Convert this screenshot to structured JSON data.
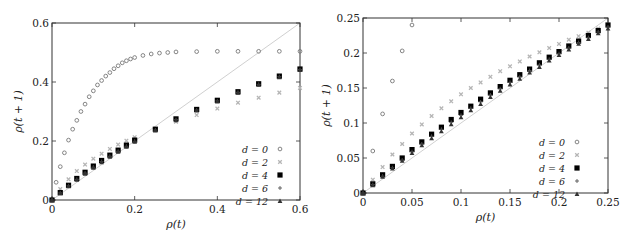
{
  "chart_data": [
    {
      "id": "left",
      "type": "scatter",
      "title": "",
      "xlabel": "ρ(t)",
      "ylabel": "ρ(t + 1)",
      "xlim": [
        0,
        0.6
      ],
      "ylim": [
        0,
        0.6
      ],
      "xticks": [
        0,
        0.2,
        0.4,
        0.6
      ],
      "xtick_labels": [
        "0",
        "0.2",
        "0.4",
        "0.6"
      ],
      "yticks": [
        0,
        0.2,
        0.4,
        0.6
      ],
      "ytick_labels": [
        "0",
        "0.2",
        "0.4",
        "0.6"
      ],
      "grid": false,
      "legend_position": "lower right",
      "reference_line": {
        "label": "y = x",
        "color": "#d0d0d0"
      },
      "series": [
        {
          "name": "d = 0",
          "marker": "open-circle",
          "color": "#777777",
          "x": [
            0,
            0.01,
            0.02,
            0.03,
            0.04,
            0.05,
            0.06,
            0.07,
            0.08,
            0.09,
            0.1,
            0.11,
            0.12,
            0.13,
            0.14,
            0.15,
            0.16,
            0.17,
            0.18,
            0.19,
            0.2,
            0.22,
            0.24,
            0.26,
            0.28,
            0.3,
            0.35,
            0.4,
            0.45,
            0.5,
            0.55,
            0.6
          ],
          "y": [
            0,
            0.06,
            0.113,
            0.16,
            0.203,
            0.24,
            0.27,
            0.3,
            0.325,
            0.35,
            0.37,
            0.39,
            0.405,
            0.42,
            0.432,
            0.445,
            0.455,
            0.465,
            0.472,
            0.478,
            0.483,
            0.49,
            0.495,
            0.498,
            0.5,
            0.502,
            0.503,
            0.504,
            0.504,
            0.504,
            0.504,
            0.504
          ]
        },
        {
          "name": "d = 2",
          "marker": "x-cross",
          "color": "#b5b5b5",
          "x": [
            0,
            0.02,
            0.04,
            0.06,
            0.08,
            0.1,
            0.12,
            0.14,
            0.16,
            0.18,
            0.2,
            0.25,
            0.3,
            0.35,
            0.4,
            0.45,
            0.5,
            0.55,
            0.6
          ],
          "y": [
            0,
            0.037,
            0.07,
            0.098,
            0.12,
            0.14,
            0.157,
            0.173,
            0.188,
            0.201,
            0.213,
            0.24,
            0.265,
            0.288,
            0.31,
            0.33,
            0.347,
            0.364,
            0.38
          ]
        },
        {
          "name": "d = 4",
          "marker": "filled-square",
          "color": "#000000",
          "x": [
            0,
            0.02,
            0.04,
            0.06,
            0.08,
            0.1,
            0.12,
            0.14,
            0.16,
            0.18,
            0.2,
            0.25,
            0.3,
            0.35,
            0.4,
            0.45,
            0.5,
            0.55,
            0.6
          ],
          "y": [
            0,
            0.025,
            0.05,
            0.073,
            0.094,
            0.115,
            0.134,
            0.152,
            0.169,
            0.186,
            0.203,
            0.24,
            0.275,
            0.307,
            0.338,
            0.367,
            0.394,
            0.42,
            0.444
          ]
        },
        {
          "name": "d = 6",
          "marker": "plus",
          "color": "#555555",
          "x": [
            0,
            0.02,
            0.04,
            0.06,
            0.08,
            0.1,
            0.12,
            0.14,
            0.16,
            0.18,
            0.2,
            0.25,
            0.3,
            0.35,
            0.4,
            0.45,
            0.5,
            0.55,
            0.6
          ],
          "y": [
            0,
            0.024,
            0.048,
            0.07,
            0.091,
            0.111,
            0.13,
            0.148,
            0.165,
            0.182,
            0.199,
            0.237,
            0.272,
            0.305,
            0.336,
            0.365,
            0.392,
            0.418,
            0.442
          ]
        },
        {
          "name": "d = 12",
          "marker": "filled-triangle",
          "color": "#333333",
          "x": [
            0,
            0.02,
            0.04,
            0.06,
            0.08,
            0.1,
            0.12,
            0.14,
            0.16,
            0.18,
            0.2,
            0.25,
            0.3,
            0.35,
            0.4,
            0.45,
            0.5,
            0.55,
            0.6
          ],
          "y": [
            0,
            0.023,
            0.046,
            0.068,
            0.089,
            0.109,
            0.128,
            0.146,
            0.163,
            0.18,
            0.197,
            0.235,
            0.27,
            0.303,
            0.334,
            0.363,
            0.39,
            0.416,
            0.44
          ]
        }
      ]
    },
    {
      "id": "right",
      "type": "scatter",
      "title": "",
      "xlabel": "ρ(t)",
      "ylabel": "ρ(t + 1)",
      "xlim": [
        0,
        0.25
      ],
      "ylim": [
        0,
        0.25
      ],
      "xticks": [
        0,
        0.05,
        0.1,
        0.15,
        0.2,
        0.25
      ],
      "xtick_labels": [
        "0",
        "0.05",
        "0.1",
        "0.15",
        "0.2",
        "0.25"
      ],
      "yticks": [
        0,
        0.05,
        0.1,
        0.15,
        0.2,
        0.25
      ],
      "ytick_labels": [
        "0",
        "0.05",
        "0.1",
        "0.15",
        "0.2",
        "0.25"
      ],
      "grid": false,
      "legend_position": "lower right",
      "reference_line": {
        "label": "y = x",
        "color": "#d0d0d0"
      },
      "series": [
        {
          "name": "d = 0",
          "marker": "open-circle",
          "color": "#777777",
          "x": [
            0,
            0.01,
            0.02,
            0.03,
            0.04,
            0.05
          ],
          "y": [
            0,
            0.06,
            0.113,
            0.16,
            0.203,
            0.24
          ]
        },
        {
          "name": "d = 2",
          "marker": "x-cross",
          "color": "#b5b5b5",
          "x": [
            0,
            0.01,
            0.02,
            0.03,
            0.04,
            0.05,
            0.06,
            0.07,
            0.08,
            0.09,
            0.1,
            0.11,
            0.12,
            0.13,
            0.14,
            0.15,
            0.16,
            0.17,
            0.18,
            0.19,
            0.2,
            0.21,
            0.22,
            0.23,
            0.24,
            0.25
          ],
          "y": [
            0,
            0.019,
            0.037,
            0.055,
            0.07,
            0.085,
            0.098,
            0.11,
            0.121,
            0.131,
            0.141,
            0.15,
            0.158,
            0.166,
            0.174,
            0.181,
            0.188,
            0.195,
            0.201,
            0.207,
            0.213,
            0.219,
            0.224,
            0.229,
            0.235,
            0.24
          ]
        },
        {
          "name": "d = 4",
          "marker": "filled-square",
          "color": "#000000",
          "x": [
            0,
            0.01,
            0.02,
            0.03,
            0.04,
            0.05,
            0.06,
            0.07,
            0.08,
            0.09,
            0.1,
            0.11,
            0.12,
            0.13,
            0.14,
            0.15,
            0.16,
            0.17,
            0.18,
            0.19,
            0.2,
            0.21,
            0.22,
            0.23,
            0.24,
            0.25
          ],
          "y": [
            0,
            0.013,
            0.026,
            0.038,
            0.05,
            0.062,
            0.073,
            0.084,
            0.094,
            0.105,
            0.115,
            0.124,
            0.134,
            0.143,
            0.152,
            0.161,
            0.169,
            0.177,
            0.186,
            0.194,
            0.202,
            0.21,
            0.217,
            0.225,
            0.232,
            0.24
          ]
        },
        {
          "name": "d = 6",
          "marker": "plus",
          "color": "#555555",
          "x": [
            0,
            0.01,
            0.02,
            0.03,
            0.04,
            0.05,
            0.06,
            0.07,
            0.08,
            0.09,
            0.1,
            0.11,
            0.12,
            0.13,
            0.14,
            0.15,
            0.16,
            0.17,
            0.18,
            0.19,
            0.2,
            0.21,
            0.22,
            0.23,
            0.24,
            0.25
          ],
          "y": [
            0,
            0.012,
            0.024,
            0.036,
            0.047,
            0.059,
            0.07,
            0.081,
            0.091,
            0.101,
            0.111,
            0.121,
            0.13,
            0.14,
            0.149,
            0.158,
            0.166,
            0.175,
            0.183,
            0.191,
            0.199,
            0.207,
            0.215,
            0.222,
            0.23,
            0.237
          ]
        },
        {
          "name": "d = 12",
          "marker": "filled-triangle",
          "color": "#333333",
          "x": [
            0,
            0.01,
            0.02,
            0.03,
            0.04,
            0.05,
            0.06,
            0.07,
            0.08,
            0.09,
            0.1,
            0.11,
            0.12,
            0.13,
            0.14,
            0.15,
            0.16,
            0.17,
            0.18,
            0.19,
            0.2,
            0.21,
            0.22,
            0.23,
            0.24,
            0.25
          ],
          "y": [
            0,
            0.011,
            0.023,
            0.035,
            0.046,
            0.057,
            0.068,
            0.078,
            0.088,
            0.098,
            0.108,
            0.118,
            0.127,
            0.137,
            0.146,
            0.155,
            0.163,
            0.172,
            0.18,
            0.189,
            0.197,
            0.205,
            0.213,
            0.22,
            0.228,
            0.235
          ]
        }
      ]
    }
  ],
  "layout": {
    "left": {
      "plot": {
        "x0": 52,
        "x1": 300,
        "y0": 200,
        "y1": 23
      },
      "legend": {
        "x": 268,
        "y": 149,
        "dy": 13
      }
    },
    "right": {
      "plot": {
        "x0": 48,
        "x1": 293,
        "y0": 193,
        "y1": 18
      },
      "legend": {
        "x": 250,
        "y": 142,
        "dy": 13
      }
    }
  }
}
